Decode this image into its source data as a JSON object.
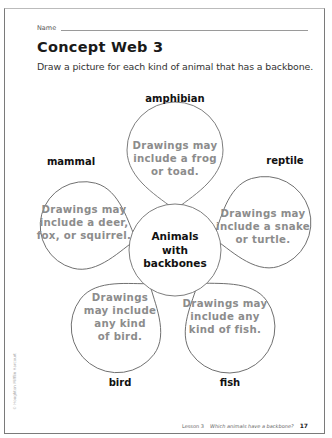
{
  "header": {
    "name_label": "Name",
    "title": "Concept Web 3",
    "instructions": "Draw a picture for each kind of animal that has a backbone."
  },
  "concept_web": {
    "center": {
      "line1": "Animals",
      "line2": "with",
      "line3": "backbones"
    },
    "petals": [
      {
        "category": "amphibian",
        "lines": [
          "Drawings may",
          "include a frog",
          "or toad."
        ]
      },
      {
        "category": "reptile",
        "lines": [
          "Drawings may",
          "include a snake",
          "or turtle."
        ]
      },
      {
        "category": "fish",
        "lines": [
          "Drawings may",
          "include any",
          "kind of fish."
        ]
      },
      {
        "category": "bird",
        "lines": [
          "Drawings",
          "may include",
          "any kind",
          "of bird."
        ]
      },
      {
        "category": "mammal",
        "lines": [
          "Drawings may",
          "include a deer,",
          "fox, or squirrel."
        ]
      }
    ]
  },
  "footer": {
    "lesson": "Lesson 3",
    "question": "Which animals have a backbone?",
    "page_number": "17",
    "copyright": "© Houghton Mifflin Harcourt"
  },
  "colors": {
    "outline": "#7a7a7a",
    "petal_text": "#8c8c8c",
    "label_text": "#111111"
  }
}
